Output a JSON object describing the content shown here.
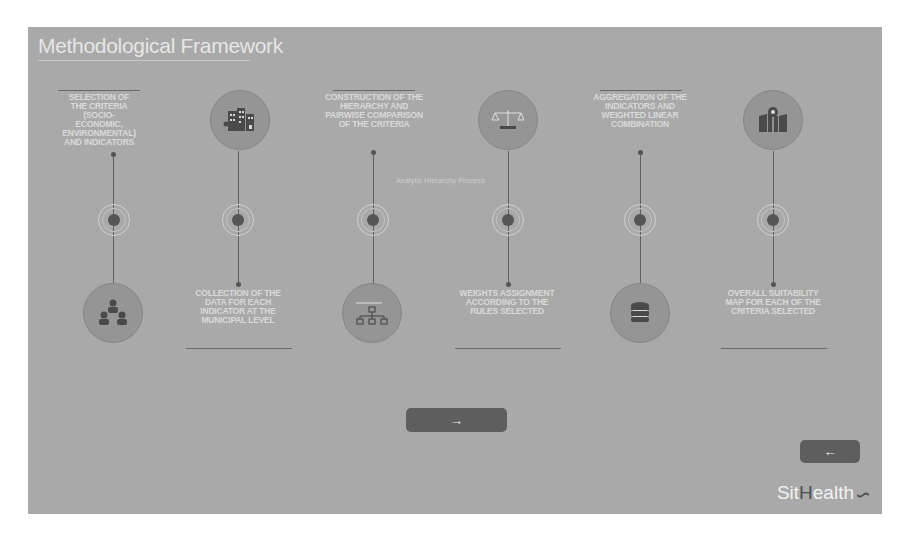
{
  "slide": {
    "title": "Methodological Framework",
    "caption": "Analytic Hierarchy Process",
    "steps": [
      {
        "position": "top",
        "text": "Selection of the criteria (socio-economic, environmental) and indicators",
        "icon": "people-hierarchy-icon"
      },
      {
        "position": "bottom",
        "text": "Collection of the data for each indicator at the municipal level",
        "icon": "city-buildings-icon"
      },
      {
        "position": "top",
        "text": "Construction of the hierarchy and pairwise comparison of the criteria",
        "icon": "org-chart-icon"
      },
      {
        "position": "bottom",
        "text": "Weights assignment according to the rules selected",
        "icon": "balance-scale-icon"
      },
      {
        "position": "top",
        "text": "Aggregation of the indicators and weighted linear combination",
        "icon": "database-icon"
      },
      {
        "position": "bottom",
        "text": "Overall suitability map for each of the criteria selected",
        "icon": "map-pin-icon"
      }
    ]
  },
  "nav": {
    "next_label": "→",
    "back_label": "←"
  },
  "brand": {
    "part1": "Sit",
    "part2": "H",
    "part3": "ealth"
  },
  "colors": {
    "slide_bg": "#a9a9a9",
    "button_bg": "#5e5e5e",
    "node_core": "#555555",
    "text_light": "#e6e6e6"
  }
}
